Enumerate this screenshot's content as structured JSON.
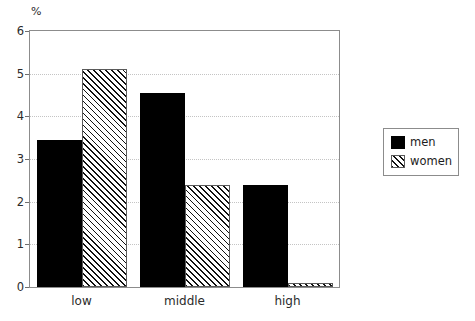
{
  "chart_data": {
    "type": "bar",
    "title": "",
    "subtitle": "",
    "xlabel": "",
    "ylabel": "%",
    "unit_label": "%",
    "categories": [
      "low",
      "middle",
      "high"
    ],
    "series": [
      {
        "name": "men",
        "values": [
          3.45,
          4.55,
          2.4
        ],
        "style": "solid-black",
        "color": "#000000"
      },
      {
        "name": "women",
        "values": [
          5.1,
          2.4,
          0.1
        ],
        "style": "diagonal-hatch",
        "color": "#ffffff"
      }
    ],
    "ylim": [
      0,
      6
    ],
    "yticks": [
      0,
      1,
      2,
      3,
      4,
      5,
      6
    ],
    "ytick_labels": [
      "0",
      "1",
      "2",
      "3",
      "4",
      "5",
      "6"
    ],
    "grid": true,
    "grid_axis": "y",
    "grid_style": "dotted",
    "grid_color": "#c4c4c4",
    "legend_position": "right-outside",
    "legend_entries": [
      "men",
      "women"
    ],
    "frame_color": "#8c8c8c",
    "background": "#ffffff"
  }
}
